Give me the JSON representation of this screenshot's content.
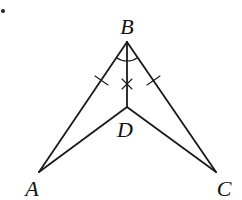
{
  "diagram": {
    "type": "geometry",
    "bullet_marker": "•",
    "stroke_color": "#1a1a1a",
    "points": {
      "A": {
        "label": "A",
        "x": 39,
        "y": 172,
        "label_x": 32,
        "label_y": 189
      },
      "B": {
        "label": "B",
        "x": 127,
        "y": 42,
        "label_x": 127,
        "label_y": 27
      },
      "C": {
        "label": "C",
        "x": 216,
        "y": 172,
        "label_x": 224,
        "label_y": 189
      },
      "D": {
        "label": "D",
        "x": 127,
        "y": 107,
        "label_x": 125,
        "label_y": 130
      }
    },
    "segments": [
      "BA",
      "BC",
      "BD",
      "DA",
      "DC"
    ],
    "markings": {
      "equal_sides": [
        "BA",
        "BC"
      ],
      "cross_tick_on": "BD",
      "angle_bisector": "BD",
      "bisected_angle": "ABC"
    }
  }
}
